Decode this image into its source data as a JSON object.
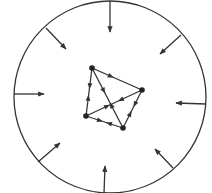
{
  "diagram": {
    "width": 212,
    "height": 193,
    "stroke_color": "#333333",
    "background": "#ffffff",
    "boundary": {
      "shape": "circle",
      "cx": 110,
      "cy": 97,
      "r": 96
    },
    "inward_arrows": [
      {
        "x1": 110,
        "y1": 1,
        "x2": 110,
        "y2": 32
      },
      {
        "x1": 46,
        "y1": 28,
        "x2": 66,
        "y2": 49
      },
      {
        "x1": 181,
        "y1": 35,
        "x2": 160,
        "y2": 54
      },
      {
        "x1": 14,
        "y1": 94,
        "x2": 44,
        "y2": 94
      },
      {
        "x1": 206,
        "y1": 104,
        "x2": 176,
        "y2": 103
      },
      {
        "x1": 38,
        "y1": 162,
        "x2": 60,
        "y2": 143
      },
      {
        "x1": 173,
        "y1": 168,
        "x2": 155,
        "y2": 149
      },
      {
        "x1": 104,
        "y1": 193,
        "x2": 105,
        "y2": 166
      }
    ],
    "nodes": [
      {
        "id": "A",
        "x": 92,
        "y": 68
      },
      {
        "id": "B",
        "x": 142,
        "y": 90
      },
      {
        "id": "C",
        "x": 123,
        "y": 128
      },
      {
        "id": "D",
        "x": 86,
        "y": 116
      }
    ],
    "edges": [
      {
        "from": "A",
        "to": "B",
        "arrows_toward": "B"
      },
      {
        "from": "A",
        "to": "D",
        "arrows_toward": "D"
      },
      {
        "from": "D",
        "to": "A",
        "arrows_toward": "A"
      },
      {
        "from": "A",
        "to": "C",
        "arrows_toward": "C"
      },
      {
        "from": "C",
        "to": "A",
        "arrows_toward": "A"
      },
      {
        "from": "D",
        "to": "B",
        "arrows_toward": "B"
      },
      {
        "from": "B",
        "to": "D",
        "arrows_toward": "D"
      },
      {
        "from": "B",
        "to": "C",
        "arrows_toward": "C"
      },
      {
        "from": "C",
        "to": "B",
        "arrows_toward": "B"
      },
      {
        "from": "C",
        "to": "D",
        "arrows_toward": "D"
      },
      {
        "from": "D",
        "to": "C",
        "arrows_toward": "C"
      }
    ]
  }
}
